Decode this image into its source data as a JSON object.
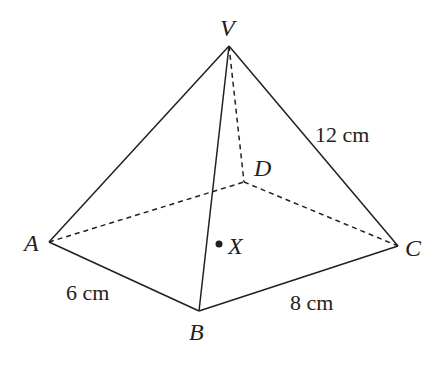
{
  "figure": {
    "type": "square-based pyramid (rectangular base)",
    "vertices": {
      "V": {
        "label": "V",
        "x": 229,
        "y": 46
      },
      "A": {
        "label": "A",
        "x": 49,
        "y": 242
      },
      "B": {
        "label": "B",
        "x": 199,
        "y": 311
      },
      "C": {
        "label": "C",
        "x": 398,
        "y": 246
      },
      "D": {
        "label": "D",
        "x": 244,
        "y": 182
      }
    },
    "point_x": {
      "label": "X",
      "x": 219,
      "y": 244
    },
    "measurements": {
      "ab": "6 cm",
      "bc": "8 cm",
      "vc": "12 cm"
    },
    "colors": {
      "stroke": "#231f20",
      "background": "#ffffff"
    }
  }
}
